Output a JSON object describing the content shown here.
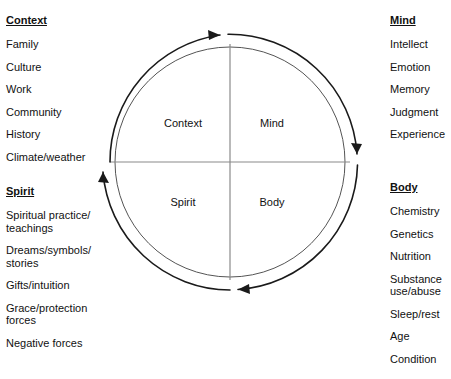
{
  "diagram": {
    "quadrants": [
      {
        "id": "context",
        "label": "Context",
        "position": "top-left"
      },
      {
        "id": "mind",
        "label": "Mind",
        "position": "top-right"
      },
      {
        "id": "spirit",
        "label": "Spirit",
        "position": "bottom-left"
      },
      {
        "id": "body",
        "label": "Body",
        "position": "bottom-right"
      }
    ],
    "cycle_direction": "clockwise",
    "arrow_count": 4,
    "colors": {
      "outline": "#1a1a1a",
      "divider": "#8a8a8a",
      "text": "#111111",
      "background": "#ffffff"
    }
  },
  "columns": {
    "left": [
      {
        "heading": "Context",
        "items": [
          "Family",
          "Culture",
          "Work",
          "Community",
          "History",
          "Climate/weather"
        ]
      },
      {
        "heading": "Spirit",
        "items": [
          "Spiritual practice/\nteachings",
          "Dreams/symbols/\nstories",
          "Gifts/intuition",
          "Grace/protection\nforces",
          "Negative forces"
        ]
      }
    ],
    "right": [
      {
        "heading": "Mind",
        "items": [
          "Intellect",
          "Emotion",
          "Memory",
          "Judgment",
          "Experience"
        ]
      },
      {
        "heading": "Body",
        "items": [
          "Chemistry",
          "Genetics",
          "Nutrition",
          "Substance\n   use/abuse",
          "Sleep/rest",
          "Age",
          "Condition"
        ]
      }
    ]
  }
}
